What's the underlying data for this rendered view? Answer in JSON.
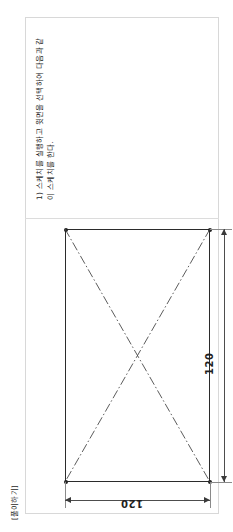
{
  "document": {
    "orientation": "rotated-90-ccw",
    "section_label": "[풀이하기]",
    "instructions": [
      "1) 스케치를 실행하고 윗면을 선택하여 다음과 같",
      "이 스케치를 한다."
    ]
  },
  "drawing": {
    "shape": "square",
    "dimension_vertical": "120",
    "dimension_horizontal": "120",
    "units": "mm",
    "construction_lines": "dash-dot diagonals",
    "centre_mark": "centre point arrows"
  },
  "colors": {
    "outline": "#2b2b2b",
    "construction": "#4a4a4a",
    "dimension": "#4d4d4d",
    "sheet_border": "#d8d8d8",
    "text": "#1c1c1c",
    "background": "#ffffff"
  }
}
